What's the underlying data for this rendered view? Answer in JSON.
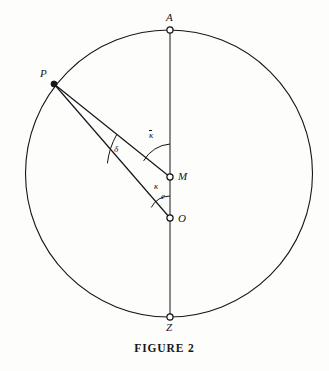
{
  "figure": {
    "caption": "FIGURE 2",
    "type": "geometric-diagram",
    "background_color": "#fdfdfc",
    "stroke_color": "#16161a",
    "points": [
      {
        "id": "A",
        "label": "A",
        "x": 170,
        "y": 30,
        "marker": "open-circle",
        "label_dx": 0,
        "label_dy": -14,
        "on_circle": true
      },
      {
        "id": "P",
        "label": "P",
        "x": 54,
        "y": 84,
        "marker": "filled-dot",
        "label_dx": -11,
        "label_dy": -9,
        "on_circle": true
      },
      {
        "id": "M",
        "label": "M",
        "x": 170,
        "y": 177,
        "marker": "open-circle",
        "label_dx": 8,
        "label_dy": 0,
        "on_circle": false
      },
      {
        "id": "O",
        "label": "O",
        "x": 170,
        "y": 218,
        "marker": "open-circle",
        "label_dx": 8,
        "label_dy": 2,
        "on_circle": false
      },
      {
        "id": "Z",
        "label": "Z",
        "x": 170,
        "y": 317,
        "marker": "open-circle",
        "label_dx": 0,
        "label_dy": 14,
        "on_circle": true
      }
    ],
    "circle": {
      "cx": 169,
      "cy": 173.5,
      "r": 143.5
    },
    "segments": [
      {
        "id": "diameter-AZ",
        "from": "A",
        "to": "Z"
      },
      {
        "id": "chord-PM",
        "from": "P",
        "to": "M"
      },
      {
        "id": "chord-PO",
        "from": "P",
        "to": "O"
      }
    ],
    "angle_labels": [
      {
        "id": "kappa-bar",
        "label": "κ",
        "overbar": true,
        "vertex": "M",
        "x": 152,
        "y": 135,
        "meaning": "angle at M between MA and MP"
      },
      {
        "id": "kappa",
        "label": "κ",
        "overbar": false,
        "vertex": "O",
        "x": 157,
        "y": 186,
        "meaning": "angle at O between OM and OP"
      },
      {
        "id": "delta",
        "label": "δ",
        "overbar": false,
        "vertex": "P",
        "x": 117,
        "y": 149,
        "meaning": "angle at P between PM and PO"
      }
    ],
    "distance_labels": [
      {
        "id": "e",
        "label": "e",
        "x": 164,
        "y": 196,
        "meaning": "distance between M and O"
      }
    ]
  }
}
